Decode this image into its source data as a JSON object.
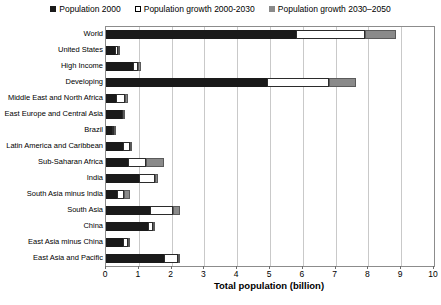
{
  "chart_data": {
    "type": "bar",
    "orientation": "horizontal",
    "stacked": true,
    "title": "",
    "xlabel": "Total population (billion)",
    "ylabel": "",
    "xlim": [
      0,
      10
    ],
    "xticks": [
      0,
      1,
      2,
      3,
      4,
      5,
      6,
      7,
      8,
      9,
      10
    ],
    "xtick_labels": [
      "0",
      "1",
      "2",
      "3",
      "4",
      "5",
      "6",
      "7",
      "8",
      "9",
      "10"
    ],
    "grid": "vertical",
    "legend_position": "top-center",
    "categories": [
      "World",
      "United States",
      "High Income",
      "Developing",
      "Middle East and North Africa",
      "East Europe and Central Asia",
      "Brazil",
      "Latin America and Caribbean",
      "Sub-Saharan Africa",
      "India",
      "South Asia minus India",
      "South Asia",
      "China",
      "East Asia minus China",
      "East Asia and Pacific"
    ],
    "series": [
      {
        "name": "Population 2000",
        "color": "#1a1a1a",
        "values": [
          5.8,
          0.28,
          0.82,
          4.91,
          0.3,
          0.48,
          0.17,
          0.52,
          0.67,
          1.01,
          0.33,
          1.35,
          1.27,
          0.52,
          1.78
        ]
      },
      {
        "name": "Population growth 2000-2030",
        "color": "#ffffff",
        "values": [
          2.1,
          0.09,
          0.16,
          1.89,
          0.27,
          0.05,
          0.08,
          0.2,
          0.55,
          0.47,
          0.22,
          0.7,
          0.16,
          0.15,
          0.42
        ]
      },
      {
        "name": "Population growth 2030-2050",
        "color": "#8a8a8a",
        "values": [
          0.94,
          0.03,
          0.09,
          0.82,
          0.1,
          0.01,
          0.02,
          0.07,
          0.55,
          0.12,
          0.17,
          0.22,
          0.03,
          0.03,
          0.07
        ]
      }
    ]
  },
  "legend": {
    "entries": [
      {
        "label": "Population 2000",
        "swatch": "filled-dark"
      },
      {
        "label": "Population growth 2000-2030",
        "swatch": "hollow-white"
      },
      {
        "label": "Population growth 2030–2050",
        "swatch": "filled-gray"
      }
    ]
  },
  "caption": {
    "text": ""
  }
}
